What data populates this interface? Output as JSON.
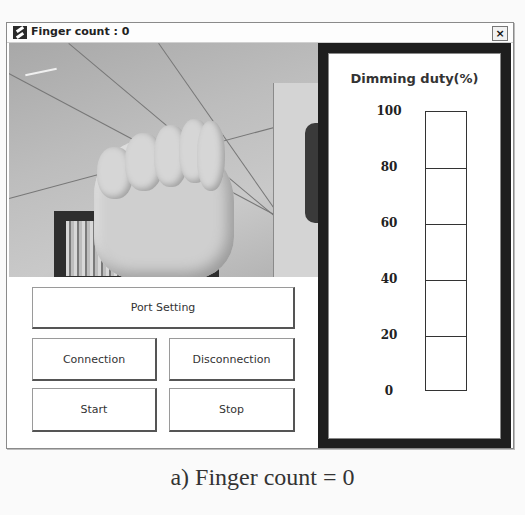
{
  "window": {
    "title": "Finger count : 0",
    "close_label": "×",
    "icon": "app-icon"
  },
  "camera": {
    "description": "webcam feed showing closed fist (0 fingers)"
  },
  "buttons": {
    "port_setting": "Port Setting",
    "connection": "Connection",
    "disconnection": "Disconnection",
    "start": "Start",
    "stop": "Stop"
  },
  "dimming_panel": {
    "title": "Dimming duty(%)",
    "ticks": [
      "100",
      "80",
      "60",
      "40",
      "20",
      "0"
    ],
    "current_value": 0,
    "bar_color": "#666666",
    "panel_border_color": "#1e1e1e"
  },
  "caption": "a) Finger count = 0"
}
